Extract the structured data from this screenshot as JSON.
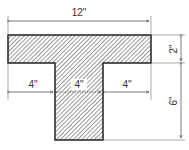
{
  "diagram": {
    "type": "T-beam cross-section",
    "dimensions": {
      "flange_width": "12\"",
      "flange_thickness": "2\"",
      "total_depth": "6\"",
      "left_overhang": "4\"",
      "web_width": "4\"",
      "right_overhang": "4\""
    }
  }
}
